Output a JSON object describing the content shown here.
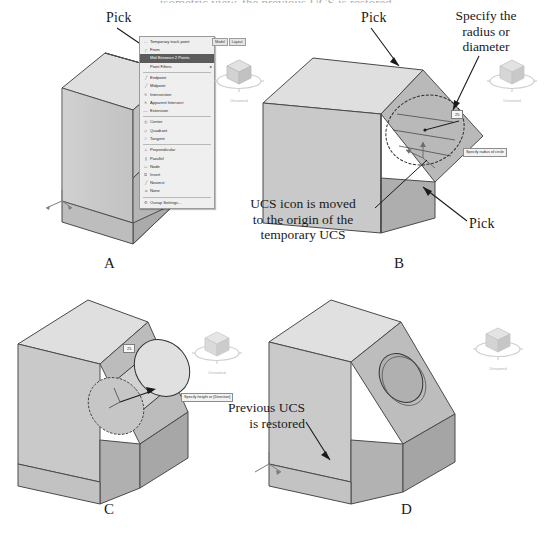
{
  "figure": {
    "cut_off_heading": "...isometric view, the previous UCS is restored.",
    "panels": [
      {
        "id": "A",
        "letter": "A"
      },
      {
        "id": "B",
        "letter": "B"
      },
      {
        "id": "C",
        "letter": "C"
      },
      {
        "id": "D",
        "letter": "D"
      }
    ]
  },
  "annotations": {
    "pick_a": "Pick",
    "pick_b_top": "Pick",
    "pick_b_bottom": "Pick",
    "specify_radius": "Specify the\nradius or\ndiameter",
    "specify_radius_line1": "Specify the",
    "specify_radius_line2": "radius or",
    "specify_radius_line3": "diameter",
    "ucs_moved_line1": "UCS icon is moved",
    "ucs_moved_line2": "to the origin of the",
    "ucs_moved_line3": "temporary UCS",
    "previous_ucs_line1": "Previous UCS",
    "previous_ucs_line2": "is restored"
  },
  "context_menu": {
    "title": "Object Snap shortcut menu",
    "selected_item": "Mid Between 2 Points",
    "groups": [
      [
        {
          "icon": "↔",
          "label": "Temporary track point",
          "submenu": false
        },
        {
          "icon": "┌",
          "label": "From",
          "submenu": false
        },
        {
          "icon": "",
          "label": "Mid Between 2 Points",
          "submenu": false,
          "selected": true
        },
        {
          "icon": "",
          "label": "Point Filters",
          "submenu": true
        }
      ],
      [
        {
          "icon": "╱",
          "label": "Endpoint",
          "submenu": false
        },
        {
          "icon": "╱",
          "label": "Midpoint",
          "submenu": false
        },
        {
          "icon": "✕",
          "label": "Intersection",
          "submenu": false
        },
        {
          "icon": "✕",
          "label": "Apparent Intersect",
          "submenu": false
        },
        {
          "icon": "—",
          "label": "Extension",
          "submenu": false
        }
      ],
      [
        {
          "icon": "◎",
          "label": "Center",
          "submenu": false
        },
        {
          "icon": "◇",
          "label": "Quadrant",
          "submenu": false
        },
        {
          "icon": "○",
          "label": "Tangent",
          "submenu": false
        }
      ],
      [
        {
          "icon": "⊥",
          "label": "Perpendicular",
          "submenu": false
        },
        {
          "icon": "∥",
          "label": "Parallel",
          "submenu": false
        },
        {
          "icon": "□",
          "label": "Node",
          "submenu": false
        },
        {
          "icon": "⧉",
          "label": "Insert",
          "submenu": false
        },
        {
          "icon": "╱",
          "label": "Nearest",
          "submenu": false
        },
        {
          "icon": "⌀",
          "label": "None",
          "submenu": false
        }
      ],
      [
        {
          "icon": "⚙",
          "label": "Osnap Settings...",
          "submenu": false
        }
      ]
    ]
  },
  "viewcube": {
    "label_a": "Unnamed",
    "label_b": "Unnamed",
    "label_c": "Unnamed",
    "label_d": "Unnamed",
    "nav_buttons": [
      "Model",
      "Layout"
    ]
  },
  "dynamic_input": {
    "circle_radius_value": "25",
    "circle_tooltip": "Specify radius of circle",
    "extrude_value": "25",
    "extrude_tooltip": "Specify height or [Direction]"
  },
  "colors": {
    "face_top": "#dcdcdc",
    "face_left": "#c9c9c9",
    "face_right": "#b4b4b4",
    "face_slope": "#bdbdbd",
    "face_dark": "#a6a6a6",
    "outline": "#4a4a4a",
    "menu_bg": "#efefef",
    "menu_selected": "#5c5c5c",
    "paper": "#ffffff",
    "ucs_icon": "#8d8d8d"
  }
}
